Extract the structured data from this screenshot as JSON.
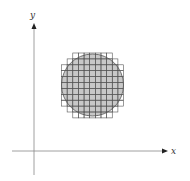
{
  "figure": {
    "x_axis_label": "x",
    "y_axis_label": "y",
    "colors": {
      "disk_fill": "#c8c8c8",
      "grid_line": "#555555",
      "axis": "#777777",
      "background": "#ffffff"
    }
  }
}
